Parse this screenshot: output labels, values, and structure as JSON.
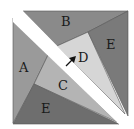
{
  "diagram": {
    "pieces": [
      {
        "id": "A",
        "label": "A",
        "color": "#9a9a9a",
        "points": "13,18 48,55 34,84 13,123",
        "label_pos": [
          19,
          72
        ]
      },
      {
        "id": "B",
        "label": "B",
        "color": "#8a8a8a",
        "points": "23,11 128,11 88,32 57,46",
        "label_pos": [
          61,
          26
        ]
      },
      {
        "id": "C",
        "label": "C",
        "color": "#b4b4b4",
        "points": "48,55 34,84 117,122",
        "label_pos": [
          58,
          90
        ]
      },
      {
        "id": "D",
        "label": "D",
        "color": "#d6d6d6",
        "points": "57,46 88,32 125,114",
        "label_pos": [
          78,
          62
        ]
      },
      {
        "id": "E-right",
        "label": "E",
        "color": "#7a7a7a",
        "points": "128,11 128,116 88,32",
        "label_pos": [
          106,
          49
        ]
      },
      {
        "id": "E-bottom",
        "label": "E",
        "color": "#6e6e6e",
        "points": "34,84 13,124 119,124",
        "label_pos": [
          41,
          113
        ]
      }
    ],
    "cut": {
      "color": "#ffffff",
      "points": "13,11 23,11 128,118 128,126 121,126 13,22"
    },
    "arrow": {
      "color": "#111111",
      "from": [
        66,
        66
      ],
      "to": [
        76,
        56
      ]
    },
    "frame": {
      "x": 13,
      "y": 11,
      "width": 115,
      "height": 113,
      "stroke": "#666666"
    }
  }
}
